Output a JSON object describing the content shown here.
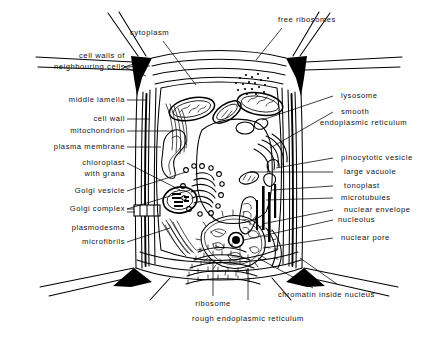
{
  "figure": {
    "type": "biology-diagram",
    "background_color": "#ffffff",
    "ink_color": "#000000"
  },
  "labels": {
    "left": [
      {
        "id": "cell-walls-of-neighbouring-cells",
        "line1": "cell walls of",
        "line2": "neighbouring cells"
      },
      {
        "id": "middle-lamella",
        "text": "middle lamella"
      },
      {
        "id": "cell-wall",
        "text": "cell wall"
      },
      {
        "id": "mitochondrion",
        "text": "mitochondrion"
      },
      {
        "id": "plasma-membrane",
        "text": "plasma membrane"
      },
      {
        "id": "chloroplast-with-grana",
        "line1": "chloroplast",
        "line2": "with grana"
      },
      {
        "id": "golgi-vesicle",
        "text": "Golgi vesicle"
      },
      {
        "id": "golgi-complex",
        "text": "Golgi complex"
      },
      {
        "id": "plasmodesma",
        "text": "plasmodesma"
      },
      {
        "id": "microfibrils",
        "text": "microfibrils"
      }
    ],
    "right": [
      {
        "id": "lysosome",
        "text": "lysosome"
      },
      {
        "id": "smooth-endoplasmic-reticulum",
        "line1": "smooth",
        "line2": "endoplasmic reticulum"
      },
      {
        "id": "pinocytotic-vesicle",
        "text": "pinocytotic vesicle"
      },
      {
        "id": "large-vacuole",
        "text": "large vacuole"
      },
      {
        "id": "tonoplast",
        "text": "tonoplast"
      },
      {
        "id": "microtubules",
        "text": "microtubuies"
      },
      {
        "id": "nuclear-envelope",
        "text": "nuclear envelope"
      },
      {
        "id": "nucleolus",
        "text": "nucleolus"
      },
      {
        "id": "nuclear-pore",
        "text": "nuclear pore"
      },
      {
        "id": "chromatin-inside-nucleus",
        "text": "chromatin inside nucleus"
      }
    ],
    "top": [
      {
        "id": "cytoplasm",
        "text": "cytoplasm"
      },
      {
        "id": "free-ribosomes",
        "text": "free ribosomes"
      }
    ],
    "bottom": [
      {
        "id": "ribosome",
        "text": "ribosome"
      },
      {
        "id": "rough-endoplasmic-reticulum",
        "text": "rough endoplasmic reticulum"
      }
    ]
  }
}
